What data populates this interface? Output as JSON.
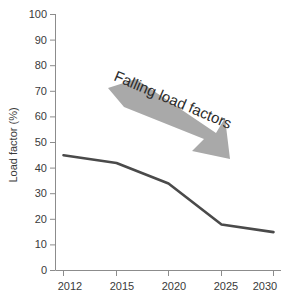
{
  "chart_data": {
    "type": "line",
    "title": "",
    "subtitle": "",
    "xlabel": "",
    "ylabel": "Load factor  (%)",
    "x": [
      "2012",
      "2015",
      "2020",
      "2025",
      "2030"
    ],
    "categories": [
      "2012",
      "2015",
      "2020",
      "2025",
      "2030"
    ],
    "values": [
      45,
      42,
      34,
      18,
      15
    ],
    "series": [
      {
        "name": "Load factor",
        "values": [
          45,
          42,
          34,
          18,
          15
        ]
      }
    ],
    "ylim": [
      0,
      100
    ],
    "ytick_labels": [
      "0",
      "10",
      "20",
      "30",
      "40",
      "50",
      "60",
      "70",
      "80",
      "90",
      "100"
    ],
    "ytick_values": [
      0,
      10,
      20,
      30,
      40,
      50,
      60,
      70,
      80,
      90,
      100
    ],
    "xtick_labels": [
      "2012",
      "2015",
      "2020",
      "2025",
      "2030"
    ],
    "grid": false,
    "legend": false,
    "legend_position": "none",
    "annotations": [
      {
        "name": "falling-load-factors-annotation",
        "text": "Falling load factors",
        "kind": "rotated-text",
        "rotation_deg": 23
      },
      {
        "name": "downward-arrow-annotation",
        "text": "",
        "kind": "block-arrow",
        "direction": "down-right"
      }
    ]
  },
  "colors": {
    "background": "#ffffff",
    "line": "#4a4a4a",
    "axis": "#8c8c8c",
    "tick_text": "#3a3a3a",
    "arrow_fill": "#a9a9a9",
    "annotation_text": "#2b2b2b"
  },
  "axes": {
    "y_title": "Load factor  (%)",
    "y_labels": [
      "100",
      "90",
      "80",
      "70",
      "60",
      "50",
      "40",
      "30",
      "20",
      "10",
      "0"
    ],
    "x_labels": [
      "2012",
      "2015",
      "2020",
      "2025",
      "2030"
    ]
  },
  "annotation": {
    "label": "Falling load factors"
  }
}
